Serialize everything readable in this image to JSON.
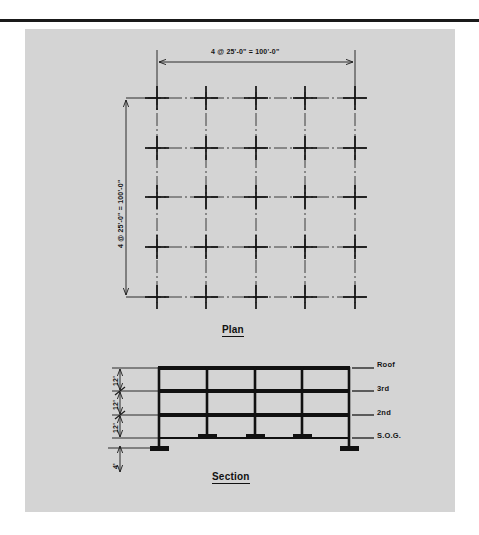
{
  "figure": {
    "background_color": "#d4d4d4",
    "line_color": "#1a1a1a",
    "page_color": "#ffffff"
  },
  "plan": {
    "title": "Plan",
    "top_dimension": "4 @ 25'-0\" = 100'-0\"",
    "left_dimension": "4 @ 25'-0\" = 100'-0\"",
    "bays_x": 4,
    "bays_y": 4,
    "grid_lines_x": 5,
    "grid_lines_y": 5,
    "bay_spacing": "25'-0\"",
    "total_span": "100'-0\""
  },
  "section": {
    "title": "Section",
    "levels": [
      {
        "label": "Roof"
      },
      {
        "label": "3rd"
      },
      {
        "label": "2nd"
      },
      {
        "label": "S.O.G."
      }
    ],
    "story_heights": [
      {
        "label": "12'"
      },
      {
        "label": "12'"
      },
      {
        "label": "12'"
      }
    ],
    "foundation_depth": {
      "label": "4'"
    },
    "bays": 4,
    "stories": 3
  }
}
